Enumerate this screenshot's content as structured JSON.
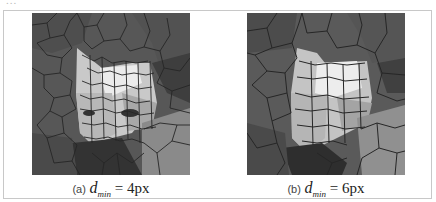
{
  "figure": {
    "top_fragment": "...",
    "panels": [
      {
        "id": "a",
        "label": "(a)",
        "symbol": "d",
        "subscript": "min",
        "equals": "=",
        "value": "4px",
        "description": "Voronoi-cell mosaic of a cat face, smaller minimum cell distance (finer cells)"
      },
      {
        "id": "b",
        "label": "(b)",
        "symbol": "d",
        "subscript": "min",
        "equals": "=",
        "value": "6px",
        "description": "Voronoi-cell mosaic of a cat face, larger minimum cell distance (coarser cells)"
      }
    ],
    "colors": {
      "frame_border": "#c8c8c8",
      "cell_edge": "#2a2a2a",
      "background_cells": "#5a5a5a",
      "bright_cells": "#e8e8e8"
    }
  }
}
